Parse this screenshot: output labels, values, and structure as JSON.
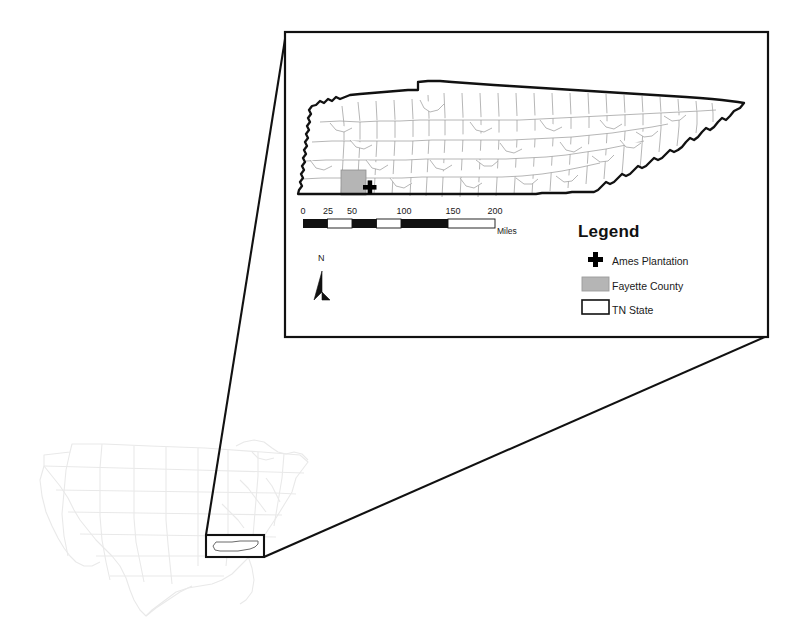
{
  "figure": {
    "kind": "locator-map",
    "title_visible": false,
    "background_color": "#ffffff"
  },
  "inset_box": {
    "x": 285,
    "y": 32,
    "width": 483,
    "height": 305,
    "border_color": "#000000",
    "border_width": 2
  },
  "leader_lines": [
    {
      "name": "left-leader",
      "from": [
        286,
        33
      ],
      "to": [
        206,
        535
      ]
    },
    {
      "name": "right-leader",
      "from": [
        767,
        336
      ],
      "to": [
        264,
        557
      ]
    }
  ],
  "us_overview": {
    "outline_color": "#e4e4e4",
    "highlight_rect": {
      "x": 206,
      "y": 535,
      "width": 58,
      "height": 22
    },
    "highlight_border_color": "#000000",
    "tn_outline_color": "#555555"
  },
  "tennessee_map": {
    "state_border_color": "#111111",
    "state_border_width": 2,
    "county_border_color": "#9a9a9a",
    "county_fill": "#ffffff",
    "fayette_fill": "#b5b5b5",
    "marker_color": "#000000"
  },
  "legend": {
    "title": "Legend",
    "items": [
      {
        "label": "Ames Plantation",
        "symbol": "plus-marker",
        "color": "#000000"
      },
      {
        "label": "Fayette County",
        "symbol": "filled-swatch",
        "color": "#b5b5b5"
      },
      {
        "label": "TN State",
        "symbol": "outline-swatch",
        "color": "#ffffff"
      }
    ]
  },
  "scale_bar": {
    "unit": "Miles",
    "tick_labels": [
      "0",
      "25",
      "50",
      "100",
      "150",
      "200"
    ],
    "tick_values": [
      0,
      25,
      50,
      100,
      150,
      200
    ],
    "tick_x": [
      303,
      328,
      352,
      404,
      453,
      495
    ],
    "bar": {
      "x": 303,
      "y": 219,
      "width": 192,
      "height": 9
    },
    "segments": [
      {
        "from": 0,
        "to": 25,
        "fill": "#111111"
      },
      {
        "from": 25,
        "to": 50,
        "fill": "#ffffff"
      },
      {
        "from": 50,
        "to": 75,
        "fill": "#111111"
      },
      {
        "from": 75,
        "to": 100,
        "fill": "#ffffff"
      },
      {
        "from": 100,
        "to": 150,
        "fill": "#111111"
      },
      {
        "from": 150,
        "to": 200,
        "fill": "#ffffff"
      },
      {
        "from": 200,
        "to": 250,
        "fill": "#111111"
      }
    ]
  },
  "north_arrow": {
    "label": "N",
    "color": "#000000"
  }
}
